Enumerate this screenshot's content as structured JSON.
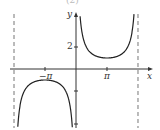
{
  "header": {
    "fragment": "(2)"
  },
  "chart_data": {
    "type": "line",
    "title": "",
    "function": "y = csc(x/2)",
    "xlabel": "x",
    "ylabel": "y",
    "x_ticks": [
      {
        "value": -3.14159,
        "label": "−π"
      },
      {
        "value": 3.14159,
        "label": "π"
      }
    ],
    "y_ticks": [
      {
        "value": 2,
        "label": "2"
      }
    ],
    "asymptotes_dashed": [
      -6.28318,
      6.28318
    ],
    "asymptotes_implicit": [
      0
    ],
    "xlim": [
      -6.8,
      7.0
    ],
    "ylim": [
      -5.0,
      6.0
    ],
    "series": [
      {
        "name": "csc(x/2), branch 1",
        "x_range": [
          -6.2,
          -0.08
        ],
        "local_max": {
          "x": -3.14159,
          "y": -1
        }
      },
      {
        "name": "csc(x/2), branch 2",
        "x_range": [
          0.08,
          6.2
        ],
        "local_min": {
          "x": 3.14159,
          "y": 1
        }
      }
    ],
    "grid": false,
    "legend": null
  },
  "colors": {
    "curve": "#222222",
    "axis": "#333333",
    "asymptote": "#777777"
  }
}
